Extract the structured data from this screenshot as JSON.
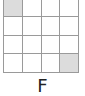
{
  "figure": {
    "label": "F",
    "grid": {
      "rows": 4,
      "cols": 4,
      "shaded_cells": [
        [
          0,
          0
        ],
        [
          3,
          3
        ]
      ],
      "shade_color": "#dcdcdc",
      "line_color": "#9a9a9a"
    }
  }
}
